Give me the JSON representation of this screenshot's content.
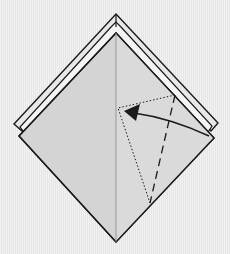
{
  "diagram": {
    "type": "origami-folding-step",
    "description": "Diamond-shaped folded paper with a reverse fold indicated on the right flap",
    "colors": {
      "background": "#ececec",
      "paper": "#d4d4d4",
      "paper_layer": "#e6e6e6",
      "outline": "#1a1a1a",
      "crease": "#9a9a9a"
    },
    "elements": {
      "outer_layer": "layered top flaps",
      "main_diamond": "paper diamond",
      "center_crease": "vertical center line",
      "valley_fold": "dashed fold line",
      "hidden_target": "dotted outline of folded position",
      "arrow": "fold direction arrow pointing up-left"
    }
  }
}
